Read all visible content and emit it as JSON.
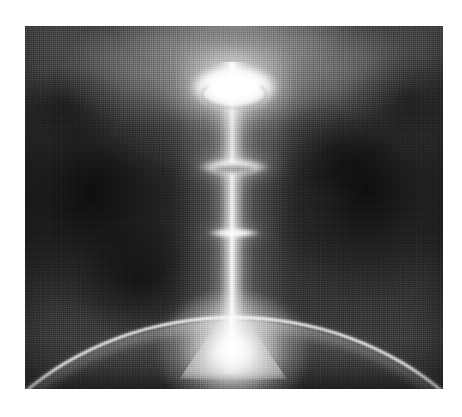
{
  "document": {
    "kind": "scanned-photograph",
    "title": "Luminous vertical jet with stacked elliptical rings above a curved bright limb",
    "caption": ""
  },
  "canvas": {
    "width_px": 462,
    "height_px": 417,
    "page_background": "#ffffff"
  },
  "plate": {
    "left_px": 25,
    "top_px": 26,
    "width_px": 418,
    "height_px": 363,
    "border": "none",
    "tone": "grayscale",
    "halftone": "coarse dot screen / dithered newsprint texture"
  },
  "palette": {
    "paper_white": "#ffffff",
    "highlight_white": "#ffffff",
    "mid_gray": "#7a7a7a",
    "field_gray": "#3a3a3a",
    "deep_shadow": "#0d0d0d",
    "upper_glow_gray": "#c4c4c4"
  },
  "scene": {
    "background_label": "dark mottled field with diffuse bright glow at top centre",
    "features": [
      {
        "name": "top-disc",
        "label": "Large bright elliptical disc / torus at top of the jet",
        "center_x_pct": 50,
        "center_y_pct": 16.8,
        "width_px": 92,
        "height_px": 48,
        "brightness": "saturated white"
      },
      {
        "name": "middle-ring",
        "label": "Middle elliptical ring on the beam",
        "center_x_pct": 50,
        "center_y_pct": 38.8,
        "width_px": 74,
        "height_px": 18,
        "brightness": "bright white"
      },
      {
        "name": "lower-ring",
        "label": "Smaller lower elliptical ring on the beam",
        "center_x_pct": 50,
        "center_y_pct": 57.0,
        "width_px": 56,
        "height_px": 11,
        "brightness": "bright white"
      },
      {
        "name": "vertical-beam",
        "label": "Narrow luminous vertical jet column",
        "center_x_pct": 49.6,
        "top_pct": 10,
        "bottom_pct": 92,
        "core_width_px": 6
      },
      {
        "name": "base-flare",
        "label": "Intense bright footpoint where the jet meets the surface",
        "center_x_pct": 49.8,
        "center_y_pct": 90,
        "diameter_px": 150
      },
      {
        "name": "limb-arc",
        "label": "Bright curved horizon arc across the lower portion",
        "apex_y_pct": 80,
        "curvature": "convex upward, apex at centre"
      },
      {
        "name": "dark-blotch-left",
        "label": "Dark mottled region left of the beam",
        "center_x_pct": 16,
        "center_y_pct": 46
      },
      {
        "name": "dark-blotch-right",
        "label": "Dark mottled region right of the beam",
        "center_x_pct": 82,
        "center_y_pct": 45
      },
      {
        "name": "upper-corona",
        "label": "Soft diffuse corona lobes flanking the top disc",
        "center_x_pct": 50,
        "center_y_pct": 15
      }
    ]
  }
}
